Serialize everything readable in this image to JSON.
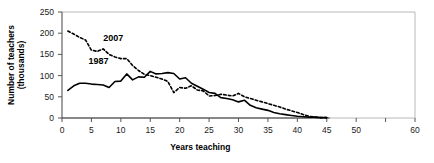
{
  "chart_data": {
    "type": "line",
    "title": "",
    "xlabel": "Years teaching",
    "ylabel": "Number of teachers (thousands)",
    "ylabel_line1": "Number of teachers",
    "ylabel_line2": "(thousands)",
    "xlim": [
      0,
      60
    ],
    "ylim": [
      0,
      250
    ],
    "xticks": [
      0,
      5,
      10,
      15,
      20,
      25,
      30,
      35,
      40,
      45,
      50,
      55,
      60
    ],
    "xtick_labels": [
      "0",
      "5",
      "10",
      "15",
      "20",
      "25",
      "30",
      "35",
      "40",
      "45",
      "50",
      "",
      "60"
    ],
    "yticks": [
      0,
      50,
      100,
      150,
      200,
      250
    ],
    "ytick_labels": [
      "0",
      "50",
      "100",
      "150",
      "200",
      "250"
    ],
    "grid": false,
    "legend": "inline-annotations",
    "series": [
      {
        "name": "1987",
        "style": "solid",
        "color": "#000000",
        "label_x": 4.5,
        "label_y": 128,
        "x": [
          1,
          2,
          3,
          4,
          5,
          6,
          7,
          8,
          9,
          10,
          11,
          12,
          13,
          14,
          15,
          16,
          17,
          18,
          19,
          20,
          21,
          22,
          23,
          24,
          25,
          26,
          27,
          28,
          29,
          30,
          31,
          32,
          33,
          34,
          35,
          36,
          37,
          38,
          39,
          40,
          41,
          42,
          43,
          44,
          45
        ],
        "values": [
          65,
          76,
          82,
          82,
          80,
          79,
          78,
          72,
          86,
          87,
          104,
          90,
          97,
          96,
          110,
          104,
          105,
          107,
          105,
          92,
          95,
          82,
          75,
          68,
          60,
          58,
          48,
          46,
          43,
          38,
          42,
          30,
          24,
          21,
          18,
          13,
          10,
          8,
          6,
          4,
          3,
          2,
          2,
          1,
          1
        ]
      },
      {
        "name": "2007",
        "style": "dashed",
        "color": "#000000",
        "label_x": 7.0,
        "label_y": 182,
        "x": [
          1,
          2,
          3,
          4,
          5,
          6,
          7,
          8,
          9,
          10,
          11,
          12,
          13,
          14,
          15,
          16,
          17,
          18,
          19,
          20,
          21,
          22,
          23,
          24,
          25,
          26,
          27,
          28,
          29,
          30,
          31,
          32,
          33,
          34,
          35,
          36,
          37,
          38,
          39,
          40,
          41,
          42,
          43,
          44,
          45
        ],
        "values": [
          205,
          198,
          190,
          184,
          160,
          157,
          163,
          150,
          144,
          140,
          140,
          124,
          112,
          103,
          100,
          96,
          92,
          86,
          60,
          72,
          70,
          76,
          66,
          64,
          52,
          53,
          56,
          54,
          52,
          58,
          50,
          46,
          42,
          38,
          34,
          30,
          26,
          21,
          17,
          13,
          8,
          4,
          2,
          1,
          1
        ]
      }
    ]
  }
}
